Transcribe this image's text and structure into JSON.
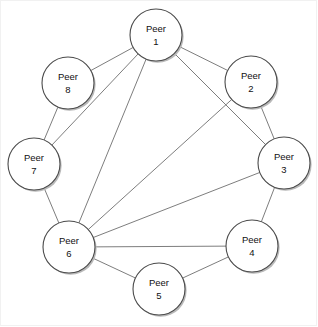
{
  "diagram": {
    "type": "node-link-graph",
    "width": 318,
    "height": 327,
    "background_color": "#ffffff",
    "border_color": "#f1f1f1",
    "node_style": {
      "radius": 26,
      "fill": "#ffffff",
      "stroke": "#4a4a4a",
      "shadow_color": "#b9b9b9"
    },
    "edge_style": {
      "stroke": "#6e6e6e",
      "width": 0.9
    },
    "nodes": [
      {
        "id": "peer1",
        "name_line1": "Peer",
        "name_line2": "1",
        "x": 156,
        "y": 35
      },
      {
        "id": "peer2",
        "name_line1": "Peer",
        "name_line2": "2",
        "x": 251,
        "y": 82
      },
      {
        "id": "peer3",
        "name_line1": "Peer",
        "name_line2": "3",
        "x": 284,
        "y": 163
      },
      {
        "id": "peer4",
        "name_line1": "Peer",
        "name_line2": "4",
        "x": 252,
        "y": 246
      },
      {
        "id": "peer5",
        "name_line1": "Peer",
        "name_line2": "5",
        "x": 159,
        "y": 289
      },
      {
        "id": "peer6",
        "name_line1": "Peer",
        "name_line2": "6",
        "x": 69,
        "y": 247
      },
      {
        "id": "peer7",
        "name_line1": "Peer",
        "name_line2": "7",
        "x": 34,
        "y": 164
      },
      {
        "id": "peer8",
        "name_line1": "Peer",
        "name_line2": "8",
        "x": 68,
        "y": 83
      }
    ],
    "edges": [
      {
        "from": "peer1",
        "to": "peer2",
        "kind": "ring"
      },
      {
        "from": "peer2",
        "to": "peer3",
        "kind": "ring"
      },
      {
        "from": "peer3",
        "to": "peer4",
        "kind": "ring"
      },
      {
        "from": "peer4",
        "to": "peer5",
        "kind": "ring"
      },
      {
        "from": "peer5",
        "to": "peer6",
        "kind": "ring"
      },
      {
        "from": "peer6",
        "to": "peer7",
        "kind": "ring"
      },
      {
        "from": "peer7",
        "to": "peer8",
        "kind": "ring"
      },
      {
        "from": "peer8",
        "to": "peer1",
        "kind": "ring"
      },
      {
        "from": "peer1",
        "to": "peer3",
        "kind": "chord"
      },
      {
        "from": "peer1",
        "to": "peer6",
        "kind": "chord"
      },
      {
        "from": "peer1",
        "to": "peer7",
        "kind": "chord"
      },
      {
        "from": "peer2",
        "to": "peer6",
        "kind": "chord"
      },
      {
        "from": "peer3",
        "to": "peer6",
        "kind": "chord"
      },
      {
        "from": "peer4",
        "to": "peer6",
        "kind": "chord"
      }
    ]
  }
}
